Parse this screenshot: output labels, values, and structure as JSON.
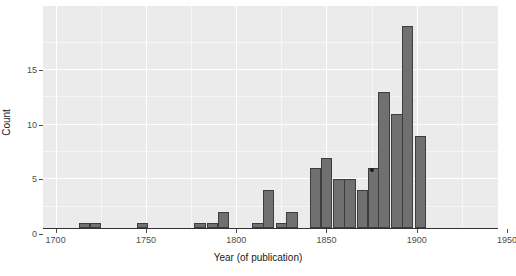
{
  "chart_data": {
    "type": "bar",
    "title": "",
    "subtitle": "",
    "xlabel": "Year (of publication)",
    "ylabel": "Count",
    "grid": true,
    "legend": null,
    "xlim": [
      1693,
      1945
    ],
    "ylim": [
      0,
      19
    ],
    "bin_width": 6.4,
    "x_ticks": [
      1700,
      1750,
      1800,
      1850,
      1900,
      1950
    ],
    "x_tick_labels": [
      "1700",
      "1750",
      "1800",
      "1850",
      "1900",
      "1950"
    ],
    "y_ticks": [
      0,
      5,
      10,
      15
    ],
    "y_tick_labels": [
      "0",
      "5",
      "10",
      "15"
    ],
    "bar_fill": "#707070",
    "bar_stroke": "#3d3d3d",
    "panel_bg": "#ebebeb",
    "grid_color": "#ffffff",
    "bins": [
      {
        "x_center": 1716,
        "value": 1
      },
      {
        "x_center": 1722,
        "value": 1
      },
      {
        "x_center": 1748,
        "value": 1
      },
      {
        "x_center": 1780,
        "value": 1
      },
      {
        "x_center": 1787,
        "value": 1
      },
      {
        "x_center": 1793,
        "value": 2
      },
      {
        "x_center": 1812,
        "value": 1
      },
      {
        "x_center": 1818,
        "value": 4
      },
      {
        "x_center": 1825,
        "value": 1
      },
      {
        "x_center": 1831,
        "value": 2
      },
      {
        "x_center": 1844,
        "value": 6
      },
      {
        "x_center": 1850,
        "value": 7
      },
      {
        "x_center": 1857,
        "value": 5
      },
      {
        "x_center": 1863,
        "value": 5
      },
      {
        "x_center": 1870,
        "value": 4
      },
      {
        "x_center": 1876,
        "value": 6
      },
      {
        "x_center": 1882,
        "value": 13
      },
      {
        "x_center": 1889,
        "value": 11
      },
      {
        "x_center": 1895,
        "value": 19
      },
      {
        "x_center": 1902,
        "value": 9
      }
    ],
    "annotations": [
      {
        "name": "speck-marker",
        "x_center": 1876,
        "value": 6
      }
    ]
  }
}
